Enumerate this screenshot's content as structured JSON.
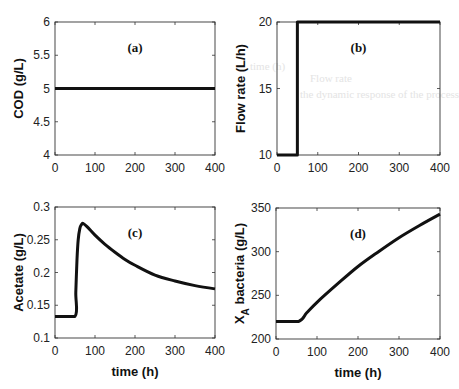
{
  "chart_data": [
    {
      "id": "a",
      "type": "line",
      "panel_label": "(a)",
      "title": "",
      "xlabel": "",
      "ylabel": "COD (g/L)",
      "xlim": [
        0,
        400
      ],
      "ylim": [
        4,
        6
      ],
      "xticks": [
        0,
        100,
        200,
        300,
        400
      ],
      "yticks": [
        4,
        4.5,
        5,
        5.5,
        6
      ],
      "ytick_labels": [
        "4",
        "4.5",
        "5",
        "5.5",
        "6"
      ],
      "grid": false,
      "series": [
        {
          "name": "COD",
          "x": [
            0,
            400
          ],
          "values": [
            5,
            5
          ]
        }
      ]
    },
    {
      "id": "b",
      "type": "line",
      "panel_label": "(b)",
      "title": "",
      "xlabel": "",
      "ylabel": "Flow rate (L/h)",
      "xlim": [
        0,
        400
      ],
      "ylim": [
        10,
        20
      ],
      "xticks": [
        0,
        100,
        200,
        300,
        400
      ],
      "yticks": [
        10,
        15,
        20
      ],
      "ytick_labels": [
        "10",
        "15",
        "20"
      ],
      "grid": false,
      "series": [
        {
          "name": "Flow rate",
          "x": [
            0,
            50,
            50,
            400
          ],
          "values": [
            10,
            10,
            20,
            20
          ]
        }
      ]
    },
    {
      "id": "c",
      "type": "line",
      "panel_label": "(c)",
      "title": "",
      "xlabel": "time (h)",
      "ylabel": "Acetate (g/L)",
      "xlim": [
        0,
        400
      ],
      "ylim": [
        0.1,
        0.3
      ],
      "xticks": [
        0,
        100,
        200,
        300,
        400
      ],
      "yticks": [
        0.1,
        0.15,
        0.2,
        0.25,
        0.3
      ],
      "ytick_labels": [
        "0.1",
        "0.15",
        "0.2",
        "0.25",
        "0.3"
      ],
      "grid": false,
      "series": [
        {
          "name": "Acetate",
          "x": [
            0,
            50,
            52,
            55,
            58,
            62,
            66,
            70,
            80,
            100,
            125,
            150,
            175,
            200,
            250,
            300,
            350,
            400
          ],
          "values": [
            0.133,
            0.133,
            0.17,
            0.22,
            0.25,
            0.267,
            0.273,
            0.275,
            0.27,
            0.257,
            0.243,
            0.231,
            0.22,
            0.211,
            0.196,
            0.187,
            0.18,
            0.175
          ]
        }
      ]
    },
    {
      "id": "d",
      "type": "line",
      "panel_label": "(d)",
      "title": "",
      "xlabel": "time (h)",
      "ylabel": "X_A bacteria (g/L)",
      "ylabel_main": "X",
      "ylabel_sub": "A",
      "ylabel_rest": " bacteria (g/L)",
      "xlim": [
        0,
        400
      ],
      "ylim": [
        200,
        350
      ],
      "xticks": [
        0,
        100,
        200,
        300,
        400
      ],
      "yticks": [
        200,
        250,
        300,
        350
      ],
      "ytick_labels": [
        "200",
        "250",
        "300",
        "350"
      ],
      "grid": false,
      "series": [
        {
          "name": "X_A bacteria",
          "x": [
            0,
            55,
            75,
            100,
            150,
            200,
            250,
            300,
            350,
            400
          ],
          "values": [
            220,
            220,
            230,
            242,
            263,
            283,
            300,
            316,
            330,
            343
          ]
        }
      ]
    }
  ],
  "background_bleed": [
    "time (h)",
    "Flow rate",
    "the dynamic response of the process"
  ]
}
